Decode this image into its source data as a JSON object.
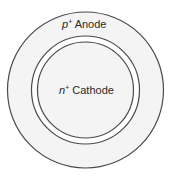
{
  "diagram": {
    "outer_region": {
      "label_prefix": "p",
      "label_sup": "+",
      "label_text": " Anode"
    },
    "inner_region": {
      "label_prefix": "n",
      "label_sup": "+",
      "label_text": " Cathode"
    },
    "colors": {
      "stroke": "#4a4a4a",
      "fill": "#f4f4f4",
      "gap_fill": "#ffffff"
    }
  }
}
